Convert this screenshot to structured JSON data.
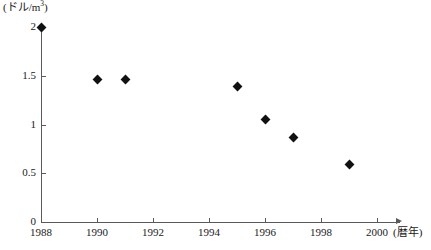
{
  "chart_data": {
    "type": "scatter",
    "title": "",
    "subtitle": "",
    "xlabel": "(暦年)",
    "ylabel": "(ドル/m3)",
    "ylabel_parts": {
      "prefix": "(ドル/m",
      "superscript": "3",
      "suffix": ")"
    },
    "x": [
      1988,
      1990,
      1991,
      1995,
      1996,
      1997,
      1999
    ],
    "values": [
      2.0,
      1.46,
      1.46,
      1.39,
      1.05,
      0.87,
      0.59
    ],
    "points": [
      {
        "year": 1988,
        "value": 2.0
      },
      {
        "year": 1990,
        "value": 1.46
      },
      {
        "year": 1991,
        "value": 1.46
      },
      {
        "year": 1995,
        "value": 1.39
      },
      {
        "year": 1996,
        "value": 1.05
      },
      {
        "year": 1997,
        "value": 0.87
      },
      {
        "year": 1999,
        "value": 0.59
      }
    ],
    "xlim": [
      1988,
      2000.8
    ],
    "ylim": [
      0,
      2
    ],
    "xticks": [
      1988,
      1990,
      1992,
      1994,
      1996,
      1998,
      2000
    ],
    "xtick_labels": [
      "1988",
      "1990",
      "1992",
      "1994",
      "1996",
      "1998",
      "2000"
    ],
    "yticks": [
      0,
      0.5,
      1,
      1.5,
      2
    ],
    "ytick_labels": [
      "0",
      "0.5",
      "1",
      "1.5",
      "2"
    ],
    "grid": false,
    "legend": null,
    "marker": "diamond",
    "marker_color": "#111111",
    "axis_color": "#5a5a5a"
  }
}
